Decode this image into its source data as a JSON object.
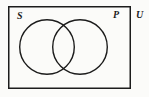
{
  "figure": {
    "kind": "venn-diagram",
    "background_color": "#fbfbf9",
    "stroke_color": "#1c1c1c",
    "fill_color": "#ffffff",
    "universe": {
      "label": "U",
      "label_position": "outside-top-right",
      "rect": {
        "x": 8,
        "y": 6,
        "width": 123,
        "height": 83
      },
      "stroke_width": 1.5
    },
    "sets": [
      {
        "label": "S",
        "label_position": "inside-top-left",
        "center_x": 47,
        "center_y": 47,
        "radius": 28,
        "stroke_width": 1.4,
        "shaded": false
      },
      {
        "label": "P",
        "label_position": "inside-top-right",
        "center_x": 80,
        "center_y": 47,
        "radius": 28,
        "stroke_width": 1.4,
        "shaded": false
      }
    ],
    "regions": {
      "intersection_shaded": false,
      "shaded_regions": []
    }
  }
}
